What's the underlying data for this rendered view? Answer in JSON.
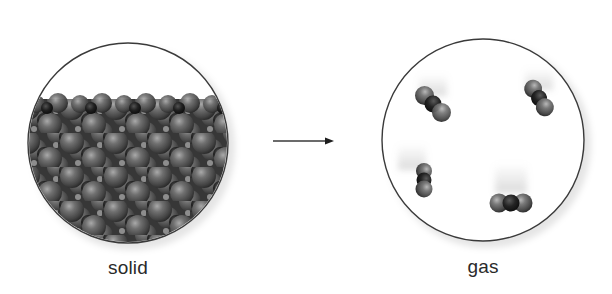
{
  "figure": {
    "panels": [
      {
        "id": "solid",
        "label": "solid",
        "description": "Closely packed lattice of molecules filling the lower portion of the circle",
        "circle": {
          "cx": 128,
          "cy": 143,
          "r": 100
        },
        "fill_top_y": 99
      },
      {
        "id": "gas",
        "label": "gas",
        "description": "Four separate triatomic molecules moving freely with motion blur",
        "circle": {
          "cx": 483,
          "cy": 140,
          "r": 101
        },
        "molecules": [
          {
            "center": [
              433,
              104
            ],
            "angle": 45
          },
          {
            "center": [
              539,
              98
            ],
            "angle": 58
          },
          {
            "center": [
              424,
              180
            ],
            "angle": 90
          },
          {
            "center": [
              511,
              203
            ],
            "angle": 0
          }
        ]
      }
    ],
    "arrow": {
      "from": [
        273,
        141
      ],
      "to": [
        334,
        141
      ],
      "direction": "right"
    },
    "colors": {
      "outline": "#3a3a3a",
      "outer_atom": "#6e6e6e",
      "center_atom": "#1e1e1e",
      "background": "#ffffff"
    }
  }
}
